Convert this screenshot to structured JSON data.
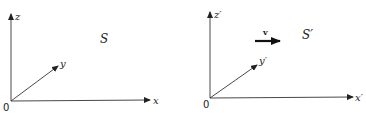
{
  "diagram": {
    "frames": [
      {
        "name": "S",
        "label": "S",
        "origin_label": "0",
        "axes": {
          "x": "x",
          "y": "y",
          "z": "z"
        }
      },
      {
        "name": "S-prime",
        "label": "S′",
        "origin_label": "0",
        "axes": {
          "x": "x′",
          "y": "y′",
          "z": "z′"
        },
        "velocity_label": "v"
      }
    ],
    "colors": {
      "ink": "#222222",
      "background": "#ffffff"
    }
  }
}
